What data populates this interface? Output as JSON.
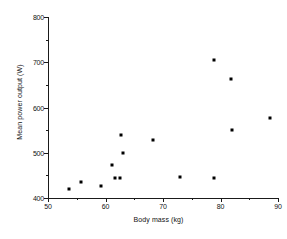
{
  "chart_data": {
    "type": "scatter",
    "title": "",
    "xlabel": "Body mass (kg)",
    "ylabel": "Mean power output (W)",
    "xlim": [
      50,
      90
    ],
    "ylim": [
      400,
      800
    ],
    "xticks": [
      50,
      60,
      70,
      80,
      90
    ],
    "xtick_labels": [
      "50",
      "60",
      "70",
      "80",
      "90"
    ],
    "xticks_minor": [
      55,
      65,
      75,
      85
    ],
    "yticks": [
      400,
      500,
      600,
      700,
      800
    ],
    "ytick_labels": [
      "400",
      "500",
      "600",
      "700",
      "800"
    ],
    "yticks_minor": [
      450,
      550,
      650,
      750
    ],
    "grid": false,
    "legend": false,
    "marker": "square",
    "marker_color": "#000000",
    "points": [
      {
        "x": 53.7,
        "y": 419
      },
      {
        "x": 55.7,
        "y": 436
      },
      {
        "x": 59.3,
        "y": 427
      },
      {
        "x": 61.1,
        "y": 474
      },
      {
        "x": 61.6,
        "y": 444
      },
      {
        "x": 62.6,
        "y": 445
      },
      {
        "x": 62.7,
        "y": 540
      },
      {
        "x": 63.1,
        "y": 500
      },
      {
        "x": 68.3,
        "y": 529
      },
      {
        "x": 73.0,
        "y": 446
      },
      {
        "x": 78.8,
        "y": 705
      },
      {
        "x": 78.8,
        "y": 445
      },
      {
        "x": 81.9,
        "y": 662
      },
      {
        "x": 82.0,
        "y": 551
      },
      {
        "x": 88.6,
        "y": 577
      }
    ]
  }
}
